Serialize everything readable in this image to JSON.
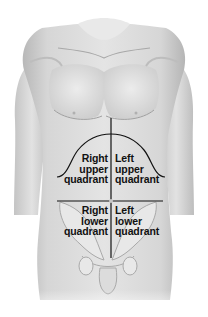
{
  "diagram": {
    "type": "anatomical-illustration",
    "colors": {
      "background": "#ffffff",
      "skin_light": "#e6e6e6",
      "skin_mid": "#cfcfcf",
      "skin_shadow": "#a9a9a9",
      "line": "#111111",
      "text": "#111111"
    },
    "quadrants": [
      {
        "id": "ruq",
        "lines": [
          "Right",
          "upper",
          "quadrant"
        ]
      },
      {
        "id": "luq",
        "lines": [
          "Left",
          "upper",
          "quadrant"
        ]
      },
      {
        "id": "rlq",
        "lines": [
          "Right",
          "lower",
          "quadrant"
        ]
      },
      {
        "id": "llq",
        "lines": [
          "Left",
          "lower",
          "quadrant"
        ]
      }
    ]
  }
}
